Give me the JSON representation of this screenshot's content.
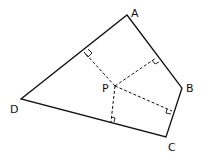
{
  "diagram": {
    "type": "quadrilateral with perpendiculars from interior point",
    "vertices": {
      "A": {
        "label": "A",
        "x": 127,
        "y": 15
      },
      "B": {
        "label": "B",
        "x": 182,
        "y": 88
      },
      "C": {
        "label": "C",
        "x": 166,
        "y": 137
      },
      "D": {
        "label": "D",
        "x": 21,
        "y": 99
      }
    },
    "point": {
      "label": "P",
      "x": 115,
      "y": 86
    },
    "feet": [
      {
        "side": "AD",
        "x": 84,
        "y": 52
      },
      {
        "side": "AB",
        "x": 156,
        "y": 58
      },
      {
        "side": "BC",
        "x": 172,
        "y": 111
      },
      {
        "side": "DC",
        "x": 111,
        "y": 122
      }
    ],
    "colors": {
      "stroke": "#111111",
      "background": "#ffffff"
    }
  }
}
